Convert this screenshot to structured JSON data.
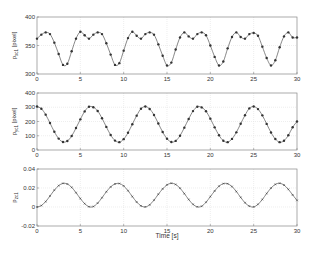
{
  "figure": {
    "xlabel": "Time [s]",
    "colors": {
      "line": "#555555",
      "marker": "#333333",
      "axis": "#888888",
      "grid": "#e2e2e2"
    }
  },
  "chart_data": [
    {
      "type": "line",
      "ylabel": "p_x,c1 [pixel]",
      "ylabel_main": "p",
      "ylabel_sub": "xc1",
      "ylabel_unit": " [pixel]",
      "xlim": [
        0,
        30
      ],
      "ylim": [
        300,
        400
      ],
      "xticks": [
        0,
        5,
        10,
        15,
        20,
        25,
        30
      ],
      "yticks": [
        300,
        350,
        400
      ],
      "grid": true,
      "marker": "dot",
      "x_step": 0.5,
      "x": [
        0,
        0.5,
        1,
        1.5,
        2,
        2.5,
        3,
        3.5,
        4,
        4.5,
        5,
        5.5,
        6,
        6.5,
        7,
        7.5,
        8,
        8.5,
        9,
        9.5,
        10,
        10.5,
        11,
        11.5,
        12,
        12.5,
        13,
        13.5,
        14,
        14.5,
        15,
        15.5,
        16,
        16.5,
        17,
        17.5,
        18,
        18.5,
        19,
        19.5,
        20,
        20.5,
        21,
        21.5,
        22,
        22.5,
        23,
        23.5,
        24,
        24.5,
        25,
        25.5,
        26,
        26.5,
        27,
        27.5,
        28,
        28.5,
        29,
        29.5,
        30
      ],
      "values": [
        362,
        369,
        373,
        370,
        355,
        335,
        316,
        318,
        340,
        362,
        374,
        368,
        362,
        369,
        373,
        370,
        354,
        334,
        316,
        319,
        341,
        363,
        374,
        367,
        362,
        370,
        373,
        369,
        352,
        332,
        315,
        320,
        343,
        364,
        373,
        366,
        362,
        370,
        373,
        368,
        350,
        330,
        315,
        322,
        345,
        365,
        373,
        365,
        362,
        370,
        372,
        367,
        348,
        328,
        315,
        324,
        347,
        366,
        373,
        364,
        364
      ]
    },
    {
      "type": "line",
      "ylabel": "p_y,c1 [pixel]",
      "ylabel_main": "p",
      "ylabel_sub": "yc1",
      "ylabel_unit": " [pixel]",
      "xlim": [
        0,
        30
      ],
      "ylim": [
        0,
        400
      ],
      "xticks": [
        0,
        5,
        10,
        15,
        20,
        25,
        30
      ],
      "yticks": [
        0,
        100,
        200,
        300,
        400
      ],
      "grid": true,
      "marker": "dot",
      "x": [
        0,
        0.5,
        1,
        1.5,
        2,
        2.5,
        3,
        3.5,
        4,
        4.5,
        5,
        5.5,
        6,
        6.5,
        7,
        7.5,
        8,
        8.5,
        9,
        9.5,
        10,
        10.5,
        11,
        11.5,
        12,
        12.5,
        13,
        13.5,
        14,
        14.5,
        15,
        15.5,
        16,
        16.5,
        17,
        17.5,
        18,
        18.5,
        19,
        19.5,
        20,
        20.5,
        21,
        21.5,
        22,
        22.5,
        23,
        23.5,
        24,
        24.5,
        25,
        25.5,
        26,
        26.5,
        27,
        27.5,
        28,
        28.5,
        29,
        29.5,
        30
      ],
      "values": [
        305,
        290,
        248,
        189,
        128,
        80,
        56,
        63,
        98,
        154,
        215,
        271,
        304,
        300,
        274,
        223,
        162,
        105,
        66,
        55,
        76,
        121,
        181,
        241,
        290,
        305,
        288,
        246,
        186,
        126,
        79,
        56,
        64,
        100,
        157,
        218,
        273,
        304,
        299,
        272,
        220,
        159,
        103,
        65,
        55,
        78,
        124,
        184,
        244,
        292,
        305,
        287,
        243,
        183,
        123,
        77,
        55,
        65,
        103,
        160,
        200
      ]
    },
    {
      "type": "line",
      "ylabel": "p_z,c1",
      "ylabel_main": "p",
      "ylabel_sub": "zc1",
      "ylabel_unit": "",
      "xlim": [
        0,
        30
      ],
      "ylim": [
        -0.02,
        0.04
      ],
      "xticks": [
        0,
        5,
        10,
        15,
        20,
        25,
        30
      ],
      "yticks": [
        -0.02,
        0,
        0.02,
        0.04
      ],
      "ytick_labels": [
        "-0.02",
        "0",
        "0.02",
        "0.04"
      ],
      "grid": true,
      "marker": "small-x",
      "x": [
        0,
        0.5,
        1,
        1.5,
        2,
        2.5,
        3,
        3.5,
        4,
        4.5,
        5,
        5.5,
        6,
        6.5,
        7,
        7.5,
        8,
        8.5,
        9,
        9.5,
        10,
        10.5,
        11,
        11.5,
        12,
        12.5,
        13,
        13.5,
        14,
        14.5,
        15,
        15.5,
        16,
        16.5,
        17,
        17.5,
        18,
        18.5,
        19,
        19.5,
        20,
        20.5,
        21,
        21.5,
        22,
        22.5,
        23,
        23.5,
        24,
        24.5,
        25,
        25.5,
        26,
        26.5,
        27,
        27.5,
        28,
        28.5,
        29,
        29.5,
        30
      ],
      "values": [
        0,
        0.0015,
        0.0057,
        0.0116,
        0.0177,
        0.0225,
        0.0249,
        0.0242,
        0.0207,
        0.0151,
        0.0089,
        0.0035,
        0.0003,
        0.0005,
        0.0041,
        0.0098,
        0.016,
        0.0212,
        0.0243,
        0.0247,
        0.0222,
        0.0172,
        0.011,
        0.0052,
        0.0012,
        0.0001,
        0.0023,
        0.0072,
        0.0134,
        0.0191,
        0.0233,
        0.025,
        0.0237,
        0.0198,
        0.0141,
        0.0079,
        0.0028,
        0.0002,
        0.0008,
        0.005,
        0.0109,
        0.0169,
        0.0219,
        0.0246,
        0.0245,
        0.0215,
        0.0163,
        0.0101,
        0.0045,
        0.0009,
        0.0001,
        0.0028,
        0.0079,
        0.0142,
        0.0199,
        0.0238,
        0.025,
        0.0231,
        0.0186,
        0.0127,
        0.007
      ]
    }
  ],
  "layout": {
    "plot_left": 37,
    "plot_right": 297,
    "panels": [
      {
        "top": 17,
        "bottom": 74
      },
      {
        "top": 93,
        "bottom": 150
      },
      {
        "top": 169,
        "bottom": 226
      }
    ],
    "xlabel_y": 238
  }
}
